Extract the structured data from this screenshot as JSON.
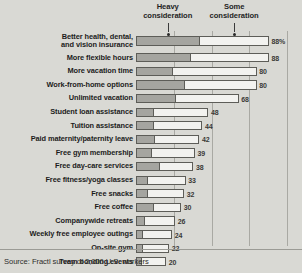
{
  "chart_data": {
    "type": "bar",
    "orientation": "horizontal",
    "stacked": true,
    "title": "",
    "xlabel": "",
    "ylabel": "",
    "xlim": [
      0,
      100
    ],
    "grid": true,
    "gridline_values": [
      25,
      50,
      75,
      100
    ],
    "legend_position": "top",
    "value_suffix_first_row": "%",
    "series": [
      {
        "name": "Heavy consideration",
        "color": "#a5a5a0",
        "values": [
          42,
          36,
          24,
          32,
          26,
          11,
          11,
          12,
          10,
          15,
          7,
          7,
          11,
          5,
          4,
          4,
          3
        ]
      },
      {
        "name": "Some consideration",
        "color": "#f2f2ef",
        "values": [
          46,
          52,
          56,
          48,
          42,
          37,
          33,
          30,
          29,
          23,
          26,
          25,
          19,
          21,
          20,
          18,
          17
        ]
      }
    ],
    "categories": [
      "Better health, dental,\nand vision insurance",
      "More flexible hours",
      "More vacation time",
      "Work-from-home options",
      "Unlimited vacation",
      "Student loan assistance",
      "Tuition assistance",
      "Paid maternity/paternity leave",
      "Free gym membership",
      "Free day-care services",
      "Free fitness/yoga classes",
      "Free snacks",
      "Free coffee",
      "Companywide retreats",
      "Weekly free employee outings",
      "On-site gym",
      "Team bonding events"
    ],
    "totals": [
      88,
      88,
      80,
      80,
      68,
      48,
      44,
      42,
      39,
      38,
      33,
      32,
      30,
      26,
      24,
      22,
      20
    ],
    "value_labels": [
      "88%",
      "88",
      "80",
      "80",
      "68",
      "48",
      "44",
      "42",
      "39",
      "38",
      "33",
      "32",
      "30",
      "26",
      "24",
      "22",
      "20"
    ]
  },
  "headers": {
    "heavy": {
      "line1": "Heavy",
      "line2": "consideration"
    },
    "some": {
      "line1": "Some",
      "line2": "consideration"
    }
  },
  "footer": {
    "source": "Source: Fractl survey of 2,000 U.S. workers"
  },
  "rows": [
    {
      "label": "Better health, dental,\nand vision insurance",
      "heavy": 42,
      "some": 46,
      "total": 88,
      "value_label": "88%"
    },
    {
      "label": "More flexible hours",
      "heavy": 36,
      "some": 52,
      "total": 88,
      "value_label": "88"
    },
    {
      "label": "More vacation time",
      "heavy": 24,
      "some": 56,
      "total": 80,
      "value_label": "80"
    },
    {
      "label": "Work-from-home options",
      "heavy": 32,
      "some": 48,
      "total": 80,
      "value_label": "80"
    },
    {
      "label": "Unlimited vacation",
      "heavy": 26,
      "some": 42,
      "total": 68,
      "value_label": "68"
    },
    {
      "label": "Student loan assistance",
      "heavy": 11,
      "some": 37,
      "total": 48,
      "value_label": "48"
    },
    {
      "label": "Tuition assistance",
      "heavy": 11,
      "some": 33,
      "total": 44,
      "value_label": "44"
    },
    {
      "label": "Paid maternity/paternity leave",
      "heavy": 12,
      "some": 30,
      "total": 42,
      "value_label": "42"
    },
    {
      "label": "Free gym membership",
      "heavy": 10,
      "some": 29,
      "total": 39,
      "value_label": "39"
    },
    {
      "label": "Free day-care services",
      "heavy": 15,
      "some": 23,
      "total": 38,
      "value_label": "38"
    },
    {
      "label": "Free fitness/yoga classes",
      "heavy": 7,
      "some": 26,
      "total": 33,
      "value_label": "33"
    },
    {
      "label": "Free snacks",
      "heavy": 7,
      "some": 25,
      "total": 32,
      "value_label": "32"
    },
    {
      "label": "Free coffee",
      "heavy": 11,
      "some": 19,
      "total": 30,
      "value_label": "30"
    },
    {
      "label": "Companywide retreats",
      "heavy": 5,
      "some": 21,
      "total": 26,
      "value_label": "26"
    },
    {
      "label": "Weekly free employee outings",
      "heavy": 4,
      "some": 20,
      "total": 24,
      "value_label": "24"
    },
    {
      "label": "On-site gym",
      "heavy": 4,
      "some": 18,
      "total": 22,
      "value_label": "22"
    },
    {
      "label": "Team bonding events",
      "heavy": 3,
      "some": 17,
      "total": 20,
      "value_label": "20"
    }
  ]
}
